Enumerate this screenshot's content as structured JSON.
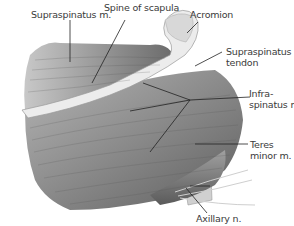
{
  "figure": {
    "labels": [
      {
        "id": "supraspinatus-m",
        "text": "Supraspinatus m.",
        "lines": [
          "Supraspinatus m."
        ]
      },
      {
        "id": "spine-of-scapula",
        "text": "Spine of scapula",
        "lines": [
          "Spine of scapula"
        ]
      },
      {
        "id": "acromion",
        "text": "Acromion",
        "lines": [
          "Acromion"
        ]
      },
      {
        "id": "supraspinatus-tendon",
        "text": "Supraspinatus tendon",
        "lines": [
          "Supraspinatus",
          "tendon"
        ]
      },
      {
        "id": "infraspinatus-m",
        "text": "Infraspinatus m.",
        "lines": [
          "Infra-",
          "spinatus m."
        ]
      },
      {
        "id": "teres-minor-m",
        "text": "Teres minor m.",
        "lines": [
          "Teres",
          "minor m."
        ]
      },
      {
        "id": "axillary-n",
        "text": "Axillary n.",
        "lines": [
          "Axillary n."
        ]
      }
    ],
    "colors": {
      "muscle_dark": "#6e6e6e",
      "muscle_mid": "#9a9a9a",
      "muscle_light": "#d6d6d6",
      "bone": "#e8e8e8",
      "label": "#3a3a3a",
      "leader": "#222222"
    }
  }
}
